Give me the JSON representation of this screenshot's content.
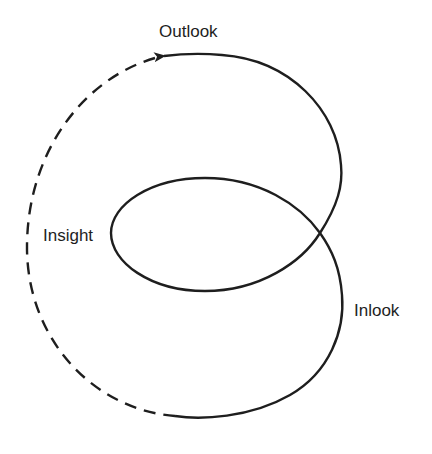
{
  "diagram": {
    "type": "self-intersecting loop cycle",
    "labels": {
      "outlook": "Outlook",
      "insight": "Insight",
      "inlook": "Inlook"
    },
    "segments": [
      {
        "name": "solid-loop",
        "style": "solid",
        "description": "From bottom, up the right lower lobe, through crossing, around inner loop, back through crossing, over the upper-right lobe, ending in arrowhead near Outlook"
      },
      {
        "name": "dashed-return",
        "style": "dashed",
        "description": "From the arrowhead sweeping counter-clockwise down the left side past Insight to the bottom"
      }
    ],
    "arrow": {
      "position": "top, near Outlook",
      "direction": "left"
    },
    "colors": {
      "stroke": "#1e1e1e",
      "background": "#ffffff"
    }
  }
}
